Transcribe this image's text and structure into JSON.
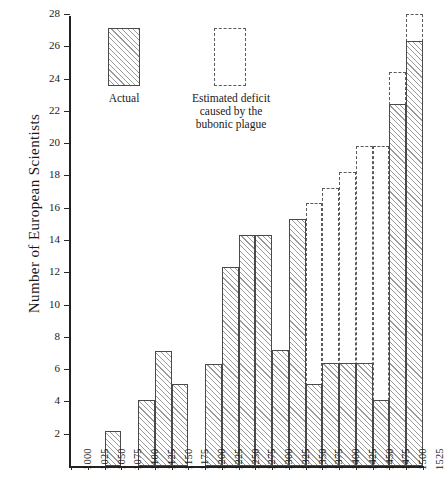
{
  "chart_data": {
    "type": "bar",
    "title": "",
    "xlabel": "",
    "ylabel": "Number of European Scientists",
    "ylim": [
      0,
      28
    ],
    "yticks": [
      2,
      4,
      6,
      8,
      10,
      12,
      14,
      16,
      18,
      20,
      22,
      24,
      26,
      28
    ],
    "xticks": [
      1000,
      1025,
      1050,
      1075,
      1100,
      1125,
      1150,
      1175,
      1200,
      1225,
      1250,
      1275,
      1300,
      1325,
      1350,
      1375,
      1400,
      1425,
      1450,
      1475,
      1500,
      1525
    ],
    "grid": false,
    "bin_width": 25,
    "categories": [
      1000,
      1025,
      1050,
      1075,
      1100,
      1125,
      1150,
      1175,
      1200,
      1225,
      1250,
      1275,
      1300,
      1325,
      1350,
      1375,
      1400,
      1425,
      1450,
      1475,
      1500
    ],
    "series": [
      {
        "name": "Actual",
        "style": "hatched-solid-outline",
        "values": [
          0,
          0,
          2.2,
          0,
          4.1,
          7.1,
          5.1,
          0,
          6.3,
          12.3,
          14.3,
          14.3,
          7.2,
          15.3,
          5.1,
          6.4,
          6.4,
          6.4,
          4.1,
          22.4,
          26.3
        ]
      },
      {
        "name": "Estimated deficit caused by the bubonic plague",
        "style": "dashed-outline",
        "values": [
          null,
          null,
          null,
          null,
          null,
          null,
          null,
          null,
          null,
          null,
          null,
          null,
          null,
          null,
          16.3,
          17.2,
          18.2,
          19.8,
          19.8,
          24.4,
          28.0
        ]
      }
    ],
    "legend": {
      "position": "top-left-inside",
      "entries": [
        {
          "label": "Actual",
          "style": "hatched-solid-outline"
        },
        {
          "label": "Estimated deficit\ncaused by the\nbubonic plague",
          "style": "dashed-outline"
        }
      ]
    }
  },
  "legend": {
    "actual_label": "Actual",
    "estimated_line1": "Estimated  deficit",
    "estimated_line2": "caused  by  the",
    "estimated_line3": "bubonic  plague"
  },
  "axes": {
    "y_title": "Number of European Scientists"
  },
  "colors": {
    "axis": "#222222",
    "bar_outline": "#4a4a4a",
    "hatch": "#9a9a9a",
    "dashed_outline": "#5a5a5a",
    "background": "#ffffff"
  }
}
